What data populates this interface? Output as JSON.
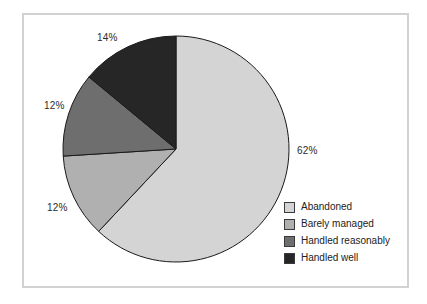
{
  "chart_data": {
    "type": "pie",
    "title": "",
    "subtitle": "",
    "xlabel": "",
    "ylabel": "",
    "legend_position": "bottom-right",
    "grid": false,
    "start_angle_deg": 0,
    "direction": "clockwise",
    "categories": [
      "Abandoned",
      "Barely managed",
      "Handled reasonably",
      "Handled well"
    ],
    "values": [
      62,
      12,
      12,
      14
    ],
    "data_labels": [
      "62%",
      "12%",
      "12%",
      "14%"
    ],
    "colors": [
      "#d4d4d4",
      "#b0b0b0",
      "#6e6e6e",
      "#262626"
    ],
    "slice_border_color": "#1a1a1a"
  },
  "frame": {
    "border_color": "#d2d2d2",
    "background": "#ffffff"
  },
  "labels": {
    "abandoned_pct": "62%",
    "barely_managed_pct": "12%",
    "handled_reasonably_pct": "12%",
    "handled_well_pct": "14%"
  },
  "legend": {
    "items": [
      {
        "label": "Abandoned",
        "color": "#d4d4d4"
      },
      {
        "label": "Barely managed",
        "color": "#b0b0b0"
      },
      {
        "label": "Handled reasonably",
        "color": "#6e6e6e"
      },
      {
        "label": "Handled well",
        "color": "#262626"
      }
    ]
  }
}
